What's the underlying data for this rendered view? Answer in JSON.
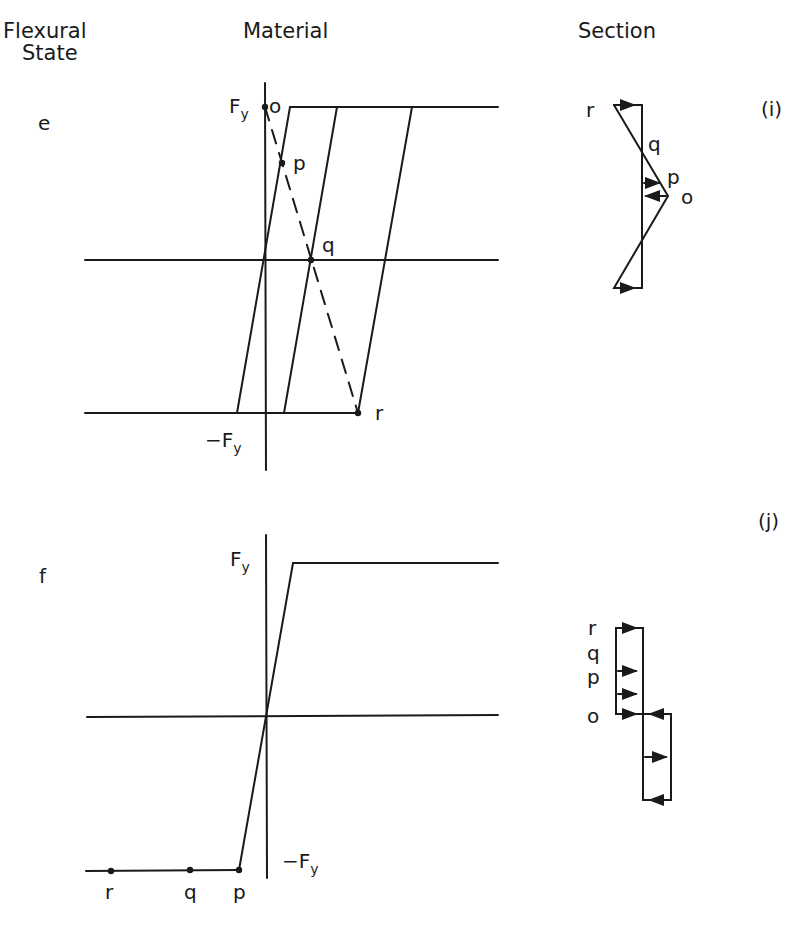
{
  "headers": {
    "flexural_state_line1": "Flexural",
    "flexural_state_line2": "State",
    "material": "Material",
    "section": "Section"
  },
  "rows": [
    {
      "state": "e",
      "panel_tag": "(i)",
      "material": {
        "fy_label": "F",
        "fy_sub": "y",
        "neg_fy_label": "−F",
        "neg_fy_sub": "y",
        "points": [
          "o",
          "p",
          "q",
          "r"
        ]
      },
      "section": {
        "labels": [
          "r",
          "q",
          "p",
          "o"
        ]
      }
    },
    {
      "state": "f",
      "panel_tag": "(j)",
      "material": {
        "fy_label": "F",
        "fy_sub": "y",
        "neg_fy_label": "−F",
        "neg_fy_sub": "y",
        "points": [
          "r",
          "q",
          "p"
        ]
      },
      "section": {
        "labels": [
          "r",
          "q",
          "p",
          "o"
        ]
      }
    }
  ],
  "colors": {
    "ink": "#1a1a1a",
    "background": "#ffffff"
  }
}
